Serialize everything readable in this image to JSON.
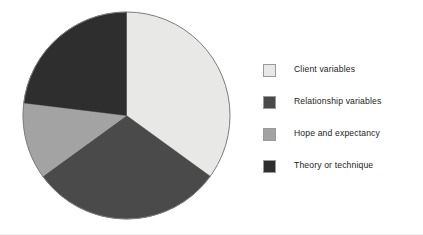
{
  "chart_data": {
    "type": "pie",
    "title": "",
    "subtitle": "",
    "xlabel": "",
    "ylabel": "",
    "grid": false,
    "legend_position": "right",
    "start_angle_deg": 0,
    "direction": "clockwise",
    "categories": [
      "Client variables",
      "Relationship variables",
      "Hope and expectancy",
      "Theory or technique"
    ],
    "values": [
      35,
      30,
      12,
      23
    ],
    "units": "percent",
    "slices": [
      {
        "label": "Client variables",
        "value": 35,
        "color": "#e8e8e6",
        "start_deg": 0,
        "end_deg": 126
      },
      {
        "label": "Relationship variables",
        "value": 30,
        "color": "#4a4a4a",
        "start_deg": 126,
        "end_deg": 234
      },
      {
        "label": "Hope and expectancy",
        "value": 12,
        "color": "#a3a3a3",
        "start_deg": 234,
        "end_deg": 277
      },
      {
        "label": "Theory or technique",
        "value": 23,
        "color": "#2e2e2e",
        "start_deg": 277,
        "end_deg": 360
      }
    ]
  },
  "pie": {
    "center_x": 104.5,
    "center_y": 104.5,
    "radius": 103.5,
    "outline_color": "#7d7d7d"
  },
  "legend": {
    "items": [
      {
        "label": "Client variables",
        "color": "#e8e8e6",
        "swatch_name": "legend-swatch-client-variables"
      },
      {
        "label": "Relationship variables",
        "color": "#4a4a4a",
        "swatch_name": "legend-swatch-relationship-variables"
      },
      {
        "label": "Hope and expectancy",
        "color": "#a3a3a3",
        "swatch_name": "legend-swatch-hope-and-expectancy"
      },
      {
        "label": "Theory or technique",
        "color": "#2e2e2e",
        "swatch_name": "legend-swatch-theory-or-technique"
      }
    ]
  },
  "colors": {
    "background": "#ffffff",
    "text": "#1c1c1c",
    "swatch_border": "#9a9a9a",
    "pie_outline": "#7d7d7d"
  }
}
